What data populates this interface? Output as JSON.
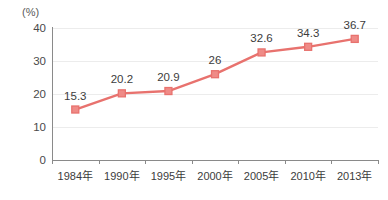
{
  "chart_data": {
    "type": "line",
    "title": "",
    "xlabel": "",
    "ylabel": "(%)",
    "unit_label": "(%)",
    "categories": [
      "1984年",
      "1990年",
      "1995年",
      "2000年",
      "2005年",
      "2010年",
      "2013年"
    ],
    "values": [
      15.3,
      20.2,
      20.9,
      26,
      32.6,
      34.3,
      36.7
    ],
    "point_labels": [
      "15.3",
      "20.2",
      "20.9",
      "26",
      "32.6",
      "34.3",
      "36.7"
    ],
    "ylim": [
      0,
      40
    ],
    "yticks": [
      0,
      10,
      20,
      30,
      40
    ],
    "ytick_labels": [
      "0",
      "10",
      "20",
      "30",
      "40"
    ],
    "grid": true,
    "legend": "none",
    "series": [
      {
        "name": "",
        "values": [
          15.3,
          20.2,
          20.9,
          26,
          32.6,
          34.3,
          36.7
        ],
        "color": "#e8726e",
        "marker": "square",
        "marker_color": "#ef8b87"
      }
    ],
    "colors": {
      "line": "#e8726e",
      "marker_fill": "#ef8b87",
      "marker_border": "#e8726e",
      "gridline": "#ececec",
      "axis": "#8a8a8a",
      "label_text": "#3c3c3c",
      "tick_text": "#4a4a4a",
      "background": "#ffffff"
    }
  }
}
